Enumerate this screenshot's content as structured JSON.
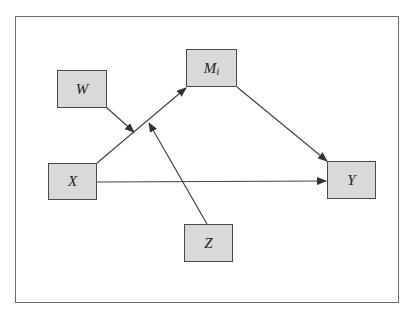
{
  "diagram": {
    "type": "moderated-mediation path model",
    "frame": {
      "border_color": "#6e6e6e"
    },
    "node_style": {
      "fill": "#d9d9d9",
      "border": "#4a4a4a",
      "text": "#222222"
    },
    "nodes": {
      "W": {
        "label": "W",
        "x": 57,
        "y": 70,
        "w": 50,
        "h": 38
      },
      "M": {
        "label": "M",
        "subscript": "i",
        "x": 186,
        "y": 49,
        "w": 51,
        "h": 38
      },
      "X": {
        "label": "X",
        "x": 48,
        "y": 163,
        "w": 49,
        "h": 37
      },
      "Y": {
        "label": "Y",
        "x": 327,
        "y": 161,
        "w": 49,
        "h": 38
      },
      "Z": {
        "label": "Z",
        "x": 184,
        "y": 224,
        "w": 49,
        "h": 38
      }
    },
    "edges": [
      {
        "from": "X",
        "to": "M",
        "description": "X to M_i path"
      },
      {
        "from": "M",
        "to": "Y",
        "description": "M_i to Y path"
      },
      {
        "from": "X",
        "to": "Y",
        "description": "direct effect X to Y"
      },
      {
        "from": "W",
        "to": "X->M path",
        "description": "W moderates X to M_i"
      },
      {
        "from": "Z",
        "to": "X->M path",
        "description": "Z moderates X to M_i"
      }
    ]
  }
}
